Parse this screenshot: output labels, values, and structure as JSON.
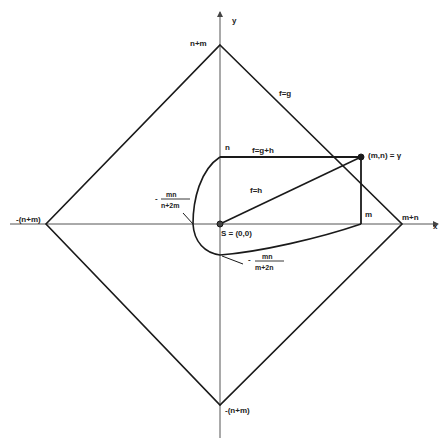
{
  "diagram": {
    "axes": {
      "x_label": "x",
      "y_label": "y"
    },
    "vertices": {
      "top": "n+m",
      "bottom": "-(n+m)",
      "left": "-(n+m)",
      "right": "m+n"
    },
    "rect_labels": {
      "n": "n",
      "m": "m"
    },
    "edge_labels": {
      "diamond_edge": "f=g",
      "top_edge": "f=g+h",
      "diagonal": "f=h"
    },
    "points": {
      "gamma": "(m,n) = γ",
      "origin": "S = (0,0)"
    },
    "curve_labels": {
      "left": {
        "prefix": "-",
        "num": "mn",
        "den": "n+2m"
      },
      "bottom": {
        "prefix": "-",
        "num": "mn",
        "den": "m+2n"
      }
    },
    "colors": {
      "line": "#1a1a1a",
      "axis": "#555555",
      "background": "#ffffff"
    }
  }
}
